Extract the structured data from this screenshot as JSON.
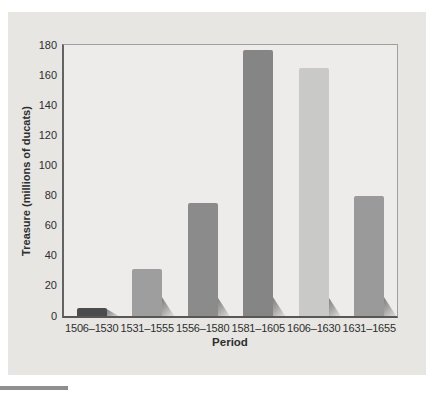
{
  "figure": {
    "page_background": "#ffffff",
    "panel_color": "#e7e6e3",
    "plot_background": "#edecea",
    "axis_color": "#575757",
    "frame_color": "#9f9f9d",
    "text_color": "#2e2e2e",
    "bottom_rule_color": "#8f8f8f"
  },
  "chart_data": {
    "type": "bar",
    "xlabel": "Period",
    "ylabel": "Treasure (millions of ducats)",
    "categories": [
      "1506–1530",
      "1531–1555",
      "1556–1580",
      "1581–1605",
      "1606–1630",
      "1631–1655"
    ],
    "values": [
      5,
      31,
      75,
      177,
      165,
      80
    ],
    "bar_colors": [
      "#4c4c4c",
      "#9e9e9e",
      "#8b8b8b",
      "#858585",
      "#c9c9c7",
      "#9a9a9a"
    ],
    "ylim": [
      0,
      180
    ],
    "yticks": [
      0,
      20,
      40,
      60,
      80,
      100,
      120,
      140,
      160,
      180
    ],
    "grid": false,
    "legend_position": "none"
  }
}
